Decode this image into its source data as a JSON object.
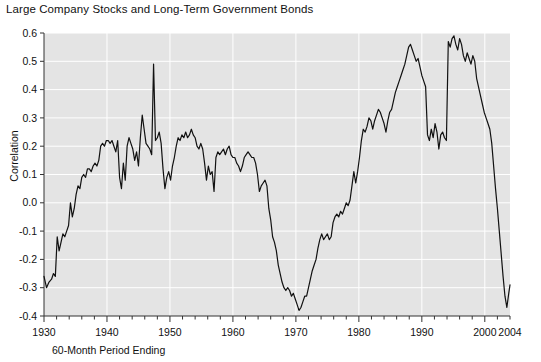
{
  "chart_data": {
    "type": "line",
    "title": "Large Company Stocks and Long-Term Government Bonds",
    "xlabel": "60-Month Period Ending",
    "ylabel": "Correlation",
    "xlim": [
      1930,
      2004
    ],
    "ylim": [
      -0.4,
      0.6
    ],
    "grid": true,
    "legend": null,
    "y_ticks": [
      "0.6",
      "0.5",
      "0.4",
      "0.3",
      "0.2",
      "0.1",
      "0.0",
      "-0.1",
      "-0.2",
      "-0.3",
      "-0.4"
    ],
    "y_tick_values": [
      0.6,
      0.5,
      0.4,
      0.3,
      0.2,
      0.1,
      0.0,
      -0.1,
      -0.2,
      -0.3,
      -0.4
    ],
    "x_ticks": [
      "1930",
      "1940",
      "1950",
      "1960",
      "1970",
      "1980",
      "1990",
      "2000",
      "2004"
    ],
    "x_tick_values": [
      1930,
      1940,
      1950,
      1960,
      1970,
      1980,
      1990,
      2000,
      2004
    ],
    "x_minor_step": 2,
    "series": [
      {
        "name": "Correlation of Large Company Stocks and Long-Term Government Bonds",
        "color": "#111111",
        "x": [
          1930.0,
          1930.4,
          1930.8,
          1931.2,
          1931.5,
          1931.8,
          1932.1,
          1932.4,
          1932.7,
          1933.0,
          1933.3,
          1933.6,
          1933.9,
          1934.2,
          1934.5,
          1934.8,
          1935.1,
          1935.4,
          1935.7,
          1936.0,
          1936.3,
          1936.6,
          1936.9,
          1937.2,
          1937.5,
          1937.8,
          1938.1,
          1938.4,
          1938.7,
          1939.0,
          1939.3,
          1939.6,
          1939.9,
          1940.2,
          1940.5,
          1940.8,
          1941.1,
          1941.4,
          1941.7,
          1942.0,
          1942.3,
          1942.6,
          1942.9,
          1943.2,
          1943.5,
          1943.8,
          1944.1,
          1944.4,
          1944.7,
          1945.0,
          1945.3,
          1945.6,
          1945.9,
          1946.2,
          1946.5,
          1946.8,
          1947.1,
          1947.4,
          1947.7,
          1948.0,
          1948.3,
          1948.6,
          1948.9,
          1949.2,
          1949.5,
          1949.8,
          1950.1,
          1950.4,
          1950.7,
          1951.0,
          1951.3,
          1951.6,
          1951.9,
          1952.2,
          1952.5,
          1952.8,
          1953.1,
          1953.4,
          1953.7,
          1954.0,
          1954.3,
          1954.6,
          1954.9,
          1955.2,
          1955.5,
          1955.8,
          1956.1,
          1956.4,
          1956.7,
          1957.0,
          1957.3,
          1957.6,
          1957.9,
          1958.2,
          1958.5,
          1958.8,
          1959.1,
          1959.4,
          1959.7,
          1960.0,
          1960.3,
          1960.6,
          1960.9,
          1961.2,
          1961.5,
          1961.8,
          1962.1,
          1962.4,
          1962.7,
          1963.0,
          1963.3,
          1963.6,
          1963.9,
          1964.2,
          1964.5,
          1964.8,
          1965.1,
          1965.4,
          1965.7,
          1966.0,
          1966.3,
          1966.6,
          1966.9,
          1967.2,
          1967.5,
          1967.8,
          1968.1,
          1968.4,
          1968.7,
          1969.0,
          1969.3,
          1969.6,
          1969.9,
          1970.2,
          1970.5,
          1970.8,
          1971.1,
          1971.4,
          1971.7,
          1972.0,
          1972.3,
          1972.6,
          1972.9,
          1973.2,
          1973.5,
          1973.8,
          1974.1,
          1974.4,
          1974.7,
          1975.0,
          1975.3,
          1975.6,
          1975.9,
          1976.2,
          1976.5,
          1976.8,
          1977.1,
          1977.4,
          1977.7,
          1978.0,
          1978.3,
          1978.6,
          1978.9,
          1979.2,
          1979.5,
          1979.8,
          1980.1,
          1980.4,
          1980.7,
          1981.0,
          1981.3,
          1981.6,
          1981.9,
          1982.2,
          1982.5,
          1982.8,
          1983.1,
          1983.4,
          1983.7,
          1984.0,
          1984.3,
          1984.6,
          1984.9,
          1985.2,
          1985.5,
          1985.8,
          1986.1,
          1986.4,
          1986.7,
          1987.0,
          1987.3,
          1987.6,
          1987.9,
          1988.2,
          1988.5,
          1988.8,
          1989.1,
          1989.4,
          1989.7,
          1990.0,
          1990.3,
          1990.6,
          1990.9,
          1991.2,
          1991.5,
          1991.8,
          1992.1,
          1992.4,
          1992.7,
          1993.0,
          1993.3,
          1993.6,
          1993.9,
          1994.2,
          1994.5,
          1994.8,
          1995.1,
          1995.4,
          1995.7,
          1996.0,
          1996.3,
          1996.6,
          1996.9,
          1997.2,
          1997.5,
          1997.8,
          1998.1,
          1998.4,
          1998.7,
          1999.0,
          1999.3,
          1999.6,
          1999.9,
          2000.2,
          2000.5,
          2000.8,
          2001.1,
          2001.4,
          2001.7,
          2002.0,
          2002.3,
          2002.6,
          2002.9,
          2003.2,
          2003.5,
          2003.8,
          2004.0
        ],
        "y": [
          -0.26,
          -0.3,
          -0.28,
          -0.27,
          -0.25,
          -0.26,
          -0.12,
          -0.17,
          -0.14,
          -0.11,
          -0.12,
          -0.1,
          -0.08,
          0.0,
          -0.05,
          -0.02,
          0.03,
          0.06,
          0.05,
          0.09,
          0.1,
          0.09,
          0.12,
          0.12,
          0.11,
          0.13,
          0.14,
          0.13,
          0.15,
          0.2,
          0.21,
          0.2,
          0.22,
          0.22,
          0.21,
          0.22,
          0.2,
          0.18,
          0.22,
          0.09,
          0.05,
          0.14,
          0.08,
          0.2,
          0.23,
          0.21,
          0.19,
          0.15,
          0.18,
          0.13,
          0.23,
          0.31,
          0.26,
          0.21,
          0.2,
          0.19,
          0.17,
          0.49,
          0.22,
          0.23,
          0.25,
          0.21,
          0.12,
          0.05,
          0.09,
          0.11,
          0.08,
          0.13,
          0.16,
          0.2,
          0.23,
          0.22,
          0.24,
          0.23,
          0.25,
          0.23,
          0.24,
          0.26,
          0.24,
          0.23,
          0.2,
          0.19,
          0.21,
          0.19,
          0.14,
          0.08,
          0.13,
          0.1,
          0.11,
          0.04,
          0.16,
          0.18,
          0.17,
          0.18,
          0.19,
          0.17,
          0.19,
          0.2,
          0.17,
          0.16,
          0.16,
          0.14,
          0.13,
          0.11,
          0.13,
          0.16,
          0.17,
          0.18,
          0.17,
          0.16,
          0.16,
          0.14,
          0.1,
          0.04,
          0.06,
          0.07,
          0.08,
          0.06,
          -0.02,
          -0.06,
          -0.12,
          -0.14,
          -0.17,
          -0.22,
          -0.25,
          -0.28,
          -0.3,
          -0.31,
          -0.3,
          -0.31,
          -0.33,
          -0.32,
          -0.34,
          -0.36,
          -0.38,
          -0.37,
          -0.35,
          -0.33,
          -0.33,
          -0.3,
          -0.27,
          -0.24,
          -0.22,
          -0.2,
          -0.16,
          -0.13,
          -0.11,
          -0.13,
          -0.12,
          -0.11,
          -0.13,
          -0.12,
          -0.07,
          -0.05,
          -0.04,
          -0.05,
          -0.03,
          -0.04,
          -0.02,
          0.0,
          -0.01,
          0.01,
          0.06,
          0.11,
          0.07,
          0.11,
          0.16,
          0.22,
          0.26,
          0.25,
          0.27,
          0.3,
          0.29,
          0.26,
          0.29,
          0.31,
          0.33,
          0.32,
          0.3,
          0.28,
          0.25,
          0.29,
          0.32,
          0.33,
          0.36,
          0.39,
          0.41,
          0.43,
          0.45,
          0.47,
          0.49,
          0.52,
          0.55,
          0.56,
          0.54,
          0.52,
          0.5,
          0.51,
          0.48,
          0.45,
          0.43,
          0.41,
          0.24,
          0.22,
          0.26,
          0.23,
          0.28,
          0.25,
          0.19,
          0.24,
          0.25,
          0.23,
          0.22,
          0.57,
          0.55,
          0.58,
          0.59,
          0.56,
          0.54,
          0.58,
          0.56,
          0.52,
          0.5,
          0.53,
          0.51,
          0.49,
          0.52,
          0.5,
          0.44,
          0.41,
          0.38,
          0.35,
          0.32,
          0.3,
          0.28,
          0.26,
          0.21,
          0.13,
          0.05,
          -0.02,
          -0.1,
          -0.18,
          -0.26,
          -0.33,
          -0.37,
          -0.32,
          -0.29
        ]
      }
    ]
  }
}
